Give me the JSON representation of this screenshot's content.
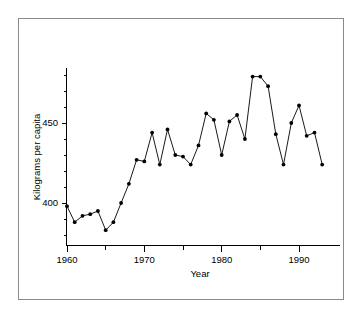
{
  "figure": {
    "background_color": "#ffffff",
    "frame_color": "#8a8a8a",
    "line_color": "#000000",
    "marker_color": "#000000"
  },
  "chart_data": {
    "type": "line",
    "title": "",
    "xlabel": "Year",
    "ylabel": "Kilograms per capita",
    "xlim": [
      1959,
      1994
    ],
    "ylim": [
      372,
      492
    ],
    "grid": false,
    "legend": null,
    "x_ticks_major": [
      1960,
      1970,
      1980,
      1990
    ],
    "x_tick_labels": [
      "1960",
      "1970",
      "1980",
      "1990"
    ],
    "x_ticks_minor": [
      1965,
      1975,
      1985
    ],
    "y_ticks_major": [
      400,
      450
    ],
    "y_tick_labels": [
      "400",
      "450"
    ],
    "y_ticks_minor": [
      380,
      390,
      410,
      420,
      430,
      440,
      460,
      470,
      480
    ],
    "marker": "filled-circle",
    "x": [
      1960,
      1961,
      1962,
      1963,
      1964,
      1965,
      1966,
      1967,
      1968,
      1969,
      1970,
      1971,
      1972,
      1973,
      1974,
      1975,
      1976,
      1977,
      1978,
      1979,
      1980,
      1981,
      1982,
      1983,
      1984,
      1985,
      1986,
      1987,
      1988,
      1989,
      1990,
      1991,
      1992,
      1993
    ],
    "values": [
      398,
      388,
      392,
      393,
      395,
      383,
      388,
      400,
      412,
      427,
      426,
      444,
      424,
      446,
      430,
      429,
      424,
      436,
      456,
      452,
      430,
      451,
      455,
      440,
      479,
      479,
      473,
      443,
      424,
      450,
      461,
      442,
      444,
      424
    ],
    "series": [
      {
        "name": "Kilograms per capita",
        "values": [
          398,
          388,
          392,
          393,
          395,
          383,
          388,
          400,
          412,
          427,
          426,
          444,
          424,
          446,
          430,
          429,
          424,
          436,
          456,
          452,
          430,
          451,
          455,
          440,
          479,
          479,
          473,
          443,
          424,
          450,
          461,
          442,
          444,
          424
        ]
      }
    ]
  }
}
